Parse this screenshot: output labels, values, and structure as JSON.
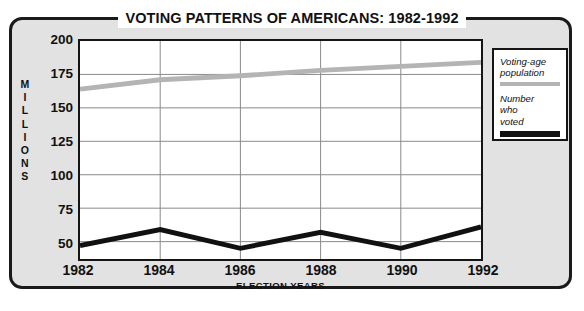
{
  "chart_data": {
    "type": "line",
    "title": "VOTING PATTERNS OF AMERICANS: 1982-1992",
    "xlabel": "ELECTION YEARS",
    "ylabel": "MILLIONS",
    "categories": [
      "1982",
      "1984",
      "1986",
      "1988",
      "1990",
      "1992"
    ],
    "x": [
      1982,
      1984,
      1986,
      1988,
      1990,
      1992
    ],
    "xlim": [
      1982,
      1992
    ],
    "ylim": [
      37,
      200
    ],
    "yticks": [
      200,
      175,
      150,
      125,
      100,
      75,
      50
    ],
    "grid": true,
    "legend_position": "right-outside",
    "series": [
      {
        "name": "Voting-age population",
        "color": "#b4b4b4",
        "values": [
          164,
          171,
          174,
          178,
          181,
          184
        ]
      },
      {
        "name": "Number who voted",
        "color": "#111111",
        "values": [
          47,
          59,
          45,
          57,
          45,
          61
        ]
      }
    ]
  },
  "figure": {
    "title": "VOTING PATTERNS OF AMERICANS: 1982-1992",
    "axis": {
      "y_title_letters": [
        "M",
        "I",
        "L",
        "L",
        "I",
        "O",
        "N",
        "S"
      ],
      "y_title": "MILLIONS",
      "x_title": "ELECTION YEARS",
      "y_ticks": [
        "200",
        "175",
        "150",
        "125",
        "100",
        "75",
        "50"
      ],
      "x_ticks": [
        "1982",
        "1984",
        "1986",
        "1988",
        "1990",
        "1992"
      ]
    },
    "legend": {
      "entries": [
        {
          "label": "Voting-age\npopulation",
          "label_line1": "Voting-age",
          "label_line2": "population",
          "color": "#b4b4b4"
        },
        {
          "label": "Number who voted",
          "label_line1": "Number",
          "label_line2": "who",
          "label_line3": "voted",
          "color": "#111111"
        }
      ]
    },
    "colors": {
      "frame_background": "#e2e2e2",
      "frame_border": "#1a1a1a",
      "plot_background": "#ffffff",
      "gridline": "#888888",
      "population_line": "#b4b4b4",
      "voted_line": "#111111"
    }
  }
}
